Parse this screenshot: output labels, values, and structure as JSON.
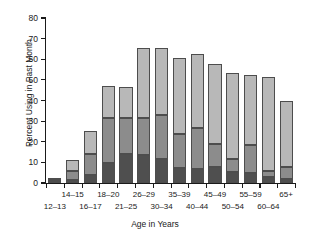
{
  "chart_data": {
    "type": "bar",
    "subtype": "stacked-bar",
    "title": "",
    "xlabel": "Age in Years",
    "ylabel": "Percent Using in Past Month",
    "ylim": [
      0,
      80
    ],
    "yticks": [
      0,
      10,
      20,
      30,
      40,
      50,
      60,
      70,
      80
    ],
    "ytick_labels": [
      "0",
      "10",
      "20",
      "30",
      "40",
      "50",
      "60",
      "70",
      "80"
    ],
    "grid": false,
    "legend": "none",
    "categories": [
      "12–13",
      "14–15",
      "16–17",
      "18–20",
      "21–25",
      "26–29",
      "30–34",
      "35–39",
      "40–44",
      "45–49",
      "50–54",
      "55–59",
      "60–64",
      "65+"
    ],
    "series": [
      {
        "name": "segment-bottom",
        "color": "#4f4f4f",
        "values": [
          0.6,
          1.5,
          3.7,
          9.9,
          14.0,
          13.7,
          11.7,
          7.5,
          6.9,
          7.7,
          5.3,
          4.9,
          3.0,
          1.8
        ]
      },
      {
        "name": "segment-middle",
        "color": "#8c8c8c",
        "values": [
          0.7,
          4.4,
          10.6,
          21.5,
          17.4,
          18.0,
          21.1,
          16.2,
          19.8,
          11.2,
          6.5,
          13.5,
          2.6,
          6.2
        ]
      },
      {
        "name": "segment-top",
        "color": "#b8b8b8",
        "values": [
          1.0,
          5.4,
          10.7,
          15.6,
          15.0,
          33.8,
          32.6,
          37.1,
          35.8,
          38.6,
          41.4,
          34.1,
          45.7,
          32.0
        ]
      }
    ],
    "totals": [
      2.3,
      11.3,
      25.0,
      47.0,
      46.4,
      65.5,
      65.4,
      60.8,
      62.5,
      57.5,
      53.2,
      52.5,
      51.3,
      40.0
    ]
  },
  "colors": {
    "axis": "#1a1a1a",
    "bar_bottom": "#4f4f4f",
    "bar_middle": "#8c8c8c",
    "bar_top": "#b8b8b8",
    "bar_outline": "#4d4d4d",
    "background": "#ffffff"
  }
}
